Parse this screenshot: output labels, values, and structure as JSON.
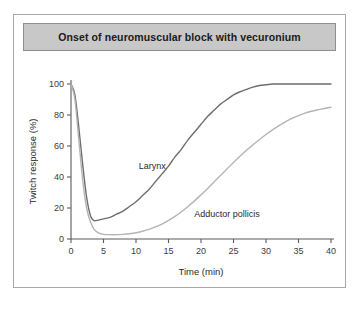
{
  "figure": {
    "title": "Onset of neuromuscular block with vecuronium"
  },
  "chart_data": {
    "type": "line",
    "title": "Onset of neuromuscular block with vecuronium",
    "xlabel": "Time (min)",
    "ylabel": "Twitch response (%)",
    "xlim": [
      0,
      40
    ],
    "ylim": [
      0,
      100
    ],
    "xticks": [
      0,
      5,
      10,
      15,
      20,
      25,
      30,
      35,
      40
    ],
    "yticks": [
      0,
      20,
      40,
      60,
      80,
      100
    ],
    "grid": false,
    "legend": "inline-annotations",
    "series": [
      {
        "name": "Larynx",
        "color": "#6e6e6e",
        "label_x": 12.5,
        "label_y": 45,
        "x": [
          0,
          0.6,
          1.2,
          1.8,
          2.4,
          3.0,
          3.5,
          4.0,
          5.0,
          6.0,
          7.0,
          8.0,
          9.0,
          10.0,
          11.0,
          12.0,
          13.0,
          14.0,
          15.0,
          16.0,
          17.0,
          18.0,
          19.0,
          20.0,
          21.0,
          22.0,
          23.0,
          24.0,
          25.0,
          26.0,
          27.0,
          28.0,
          29.0,
          30.0,
          31.0,
          32.0,
          34.0,
          36.0,
          38.0,
          40.0
        ],
        "y": [
          100,
          93,
          72,
          48,
          27,
          15,
          12,
          12,
          13,
          14,
          16,
          18,
          21,
          24,
          28,
          32,
          37,
          42,
          47,
          53,
          58,
          64,
          69,
          74,
          79,
          83,
          87,
          90,
          93,
          95,
          96.5,
          98,
          99,
          99.5,
          100,
          100,
          100,
          100,
          100,
          100
        ]
      },
      {
        "name": "Adductor pollicis",
        "color": "#b4b4b4",
        "label_x": 24,
        "label_y": 14,
        "x": [
          0,
          0.6,
          1.2,
          1.8,
          2.4,
          3.0,
          3.6,
          4.2,
          5.0,
          6.0,
          7.0,
          8.0,
          9.0,
          10.0,
          11.0,
          12.0,
          13.0,
          14.0,
          15.0,
          16.0,
          17.0,
          18.0,
          19.0,
          20.0,
          21.0,
          22.0,
          23.0,
          24.0,
          25.0,
          26.0,
          27.0,
          28.0,
          29.0,
          30.0,
          31.0,
          32.0,
          33.0,
          34.0,
          35.0,
          36.0,
          37.0,
          38.0,
          39.0,
          40.0
        ],
        "y": [
          100,
          90,
          64,
          38,
          20,
          11,
          6,
          4,
          3,
          2.8,
          2.8,
          3,
          3.4,
          4,
          5,
          6.2,
          7.8,
          9.6,
          12,
          14.6,
          17.6,
          21,
          24.6,
          28.5,
          32.5,
          36.8,
          41,
          45.2,
          49.4,
          53.4,
          57.2,
          60.8,
          64.2,
          67.4,
          70.4,
          73.2,
          75.6,
          77.8,
          79.6,
          81.2,
          82.4,
          83.4,
          84.2,
          85
        ]
      }
    ]
  }
}
